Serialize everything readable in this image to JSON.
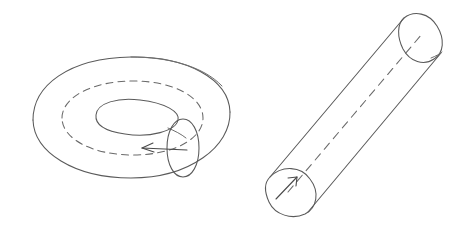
{
  "figure": {
    "title": "",
    "background_color": "#ffffff",
    "stroke_color": "#5a5a5a",
    "style": "hand-drawn line art",
    "shapes": [
      {
        "name": "torus",
        "label": "",
        "position": "left",
        "description": "A torus (doughnut) drawn in oblique view with an outer silhouette, an inner hole ellipse, a dashed core circle and a small meridian ellipse on the right side carrying a leftward arrow."
      },
      {
        "name": "cylinder",
        "label": "",
        "position": "right",
        "description": "A long cylinder (tube) tilted diagonally from lower-left to upper-right, with a visible circular face at the lower-left end, an elliptical face at the upper-right end, and a dashed axis line running through it carrying an arrow at the lower-left end."
      }
    ],
    "annotations": [
      {
        "name": "torus-meridian-arrow",
        "text": "",
        "direction": "left",
        "attached_to": "torus"
      },
      {
        "name": "cylinder-axis-arrow",
        "text": "",
        "direction": "up-right",
        "attached_to": "cylinder"
      }
    ]
  }
}
